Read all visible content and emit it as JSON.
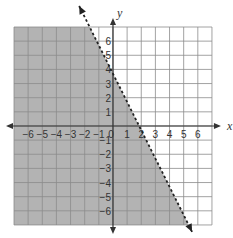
{
  "chart_data": {
    "type": "inequality-graph",
    "title": "",
    "xlabel": "x",
    "ylabel": "y",
    "xlim": [
      -7,
      7
    ],
    "ylim": [
      -7,
      7
    ],
    "grid": true,
    "x_ticks": [
      "-6",
      "-5",
      "-4",
      "-3",
      "-2",
      "-1",
      "0",
      "1",
      "2",
      "3",
      "4",
      "5",
      "6"
    ],
    "y_ticks": [
      "6",
      "5",
      "4",
      "3",
      "2",
      "1",
      "-1",
      "-2",
      "-3",
      "-4",
      "-5",
      "-6"
    ],
    "boundary_line": {
      "style": "dashed",
      "slope": -2,
      "y_intercept": 3.7,
      "x_intercept": 1.8,
      "arrows": "both ends"
    },
    "shaded_region": "below/left of the line",
    "colors": {
      "shade": "#b3b3b3",
      "grid": "#8c8c8c",
      "axis": "#333333",
      "line": "#222222"
    }
  }
}
